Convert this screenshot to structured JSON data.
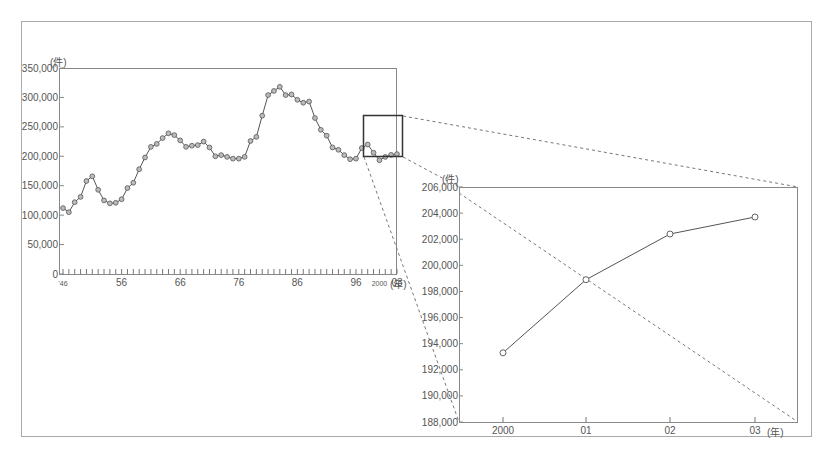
{
  "chart_data": [
    {
      "id": "main",
      "type": "line",
      "title": "",
      "ylabel": "(件)",
      "xlabel": "(年)",
      "ylim": [
        0,
        350000
      ],
      "yticks": [
        0,
        50000,
        100000,
        150000,
        200000,
        250000,
        300000,
        350000
      ],
      "ytick_labels": [
        "0",
        "50,000",
        "100,000",
        "150,000",
        "200,000",
        "250,000",
        "300,000",
        "350,000"
      ],
      "xtick_labels": [
        {
          "year": 1946,
          "label": "'46"
        },
        {
          "year": 1956,
          "label": "56"
        },
        {
          "year": 1966,
          "label": "66"
        },
        {
          "year": 1976,
          "label": "76"
        },
        {
          "year": 1986,
          "label": "86"
        },
        {
          "year": 1996,
          "label": "96"
        },
        {
          "year": 2000,
          "label": "2000"
        },
        {
          "year": 2003,
          "label": "03"
        }
      ],
      "grid": false,
      "marker": "circle",
      "x": [
        1946,
        1947,
        1948,
        1949,
        1950,
        1951,
        1952,
        1953,
        1954,
        1955,
        1956,
        1957,
        1958,
        1959,
        1960,
        1961,
        1962,
        1963,
        1964,
        1965,
        1966,
        1967,
        1968,
        1969,
        1970,
        1971,
        1972,
        1973,
        1974,
        1975,
        1976,
        1977,
        1978,
        1979,
        1980,
        1981,
        1982,
        1983,
        1984,
        1985,
        1986,
        1987,
        1988,
        1989,
        1990,
        1991,
        1992,
        1993,
        1994,
        1995,
        1996,
        1997,
        1998,
        1999,
        2000,
        2001,
        2002,
        2003
      ],
      "values": [
        112000,
        105000,
        122000,
        131000,
        158000,
        166000,
        143000,
        125000,
        120000,
        121000,
        127000,
        146000,
        155000,
        178000,
        198000,
        216000,
        221000,
        231000,
        239000,
        236000,
        227000,
        216000,
        218000,
        219000,
        225000,
        215000,
        200000,
        202000,
        199000,
        196000,
        196000,
        199000,
        226000,
        233000,
        269000,
        304000,
        311000,
        318000,
        304000,
        305000,
        296000,
        291000,
        293000,
        265000,
        245000,
        235000,
        215000,
        211000,
        202000,
        195000,
        196000,
        214000,
        220000,
        206000,
        193300,
        198900,
        202400,
        203700
      ]
    },
    {
      "id": "inset",
      "type": "line",
      "title": "",
      "ylabel": "(件)",
      "xlabel": "(年)",
      "ylim": [
        188000,
        206000
      ],
      "yticks": [
        188000,
        190000,
        192000,
        194000,
        196000,
        198000,
        200000,
        202000,
        204000,
        206000
      ],
      "ytick_labels": [
        "188,000",
        "190,000",
        "192,000",
        "194,000",
        "196,000",
        "198,000",
        "200,000",
        "202,000",
        "204,000",
        "206,000"
      ],
      "categories": [
        "2000",
        "01",
        "02",
        "03"
      ],
      "values": [
        193300,
        198900,
        202400,
        203700
      ],
      "grid": false,
      "marker": "circle"
    }
  ],
  "colors": {
    "line": "#555555",
    "marker_fill": "#bbbbbb",
    "frame": "#999999",
    "zoom_box": "#333333"
  }
}
